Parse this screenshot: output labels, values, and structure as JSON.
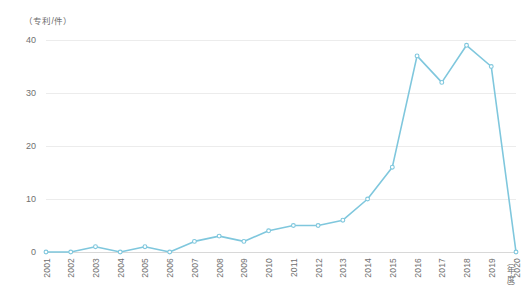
{
  "chart_data": {
    "type": "line",
    "title": "",
    "subtitle": "",
    "xlabel": "（年度）",
    "ylabel": "（专利/件）",
    "categories": [
      "2001",
      "2002",
      "2003",
      "2004",
      "2005",
      "2006",
      "2007",
      "2008",
      "2009",
      "2010",
      "2011",
      "2012",
      "2013",
      "2014",
      "2015",
      "2016",
      "2017",
      "2018",
      "2019",
      "2020"
    ],
    "values": [
      0,
      0,
      1,
      0,
      1,
      0,
      2,
      3,
      2,
      4,
      5,
      5,
      6,
      10,
      16,
      37,
      32,
      39,
      35,
      0
    ],
    "series": [
      {
        "name": "专利数量",
        "values": [
          0,
          0,
          1,
          0,
          1,
          0,
          2,
          3,
          2,
          4,
          5,
          5,
          6,
          10,
          16,
          37,
          32,
          39,
          35,
          0
        ]
      }
    ],
    "ylim": [
      0,
      40
    ],
    "y_ticks": [
      0,
      10,
      20,
      30,
      40
    ],
    "y_tick_labels": [
      "0",
      "10",
      "20",
      "30",
      "40"
    ],
    "grid": true,
    "grid_axis": "y",
    "legend": false,
    "legend_position": "none",
    "markers": true,
    "line_color": "#7fc7dd",
    "marker_color": "#7fc7dd",
    "grid_color": "#ececec",
    "axis_color": "#d8d8d8",
    "tick_label_color": "#6f6f6f",
    "background_color": "#ffffff"
  }
}
